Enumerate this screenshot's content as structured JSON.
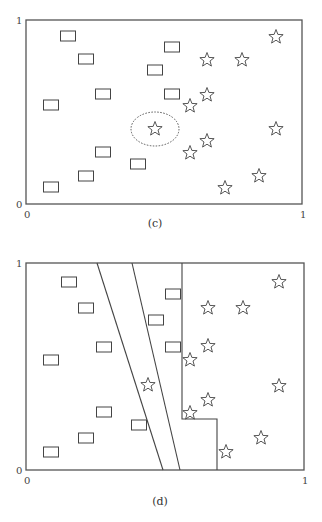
{
  "panels": [
    {
      "id": "c",
      "caption": "(c)",
      "frame": {
        "x": 26,
        "y": 20,
        "w": 276,
        "h": 184
      },
      "ticks": {
        "y_top": "1",
        "y_bottom": "0",
        "x_left": "0",
        "x_right": "1"
      },
      "caption_pos": {
        "x": 155,
        "y": 227
      },
      "rect_markers": [
        [
          68,
          36
        ],
        [
          86,
          59
        ],
        [
          103,
          94
        ],
        [
          51,
          105
        ],
        [
          172,
          47
        ],
        [
          155,
          70
        ],
        [
          172,
          94
        ],
        [
          103,
          152
        ],
        [
          86,
          176
        ],
        [
          51,
          187
        ],
        [
          138,
          164
        ]
      ],
      "star_markers": [
        [
          276,
          37
        ],
        [
          207,
          60
        ],
        [
          242,
          60
        ],
        [
          207,
          95
        ],
        [
          190,
          106
        ],
        [
          155,
          129
        ],
        [
          276,
          129
        ],
        [
          207,
          141
        ],
        [
          190,
          153
        ],
        [
          259,
          176
        ],
        [
          225,
          188
        ]
      ],
      "highlight_ellipse": {
        "cx": 155,
        "cy": 129,
        "rx": 24,
        "ry": 17
      },
      "boundaries": []
    },
    {
      "id": "d",
      "caption": "(d)",
      "frame": {
        "x": 26,
        "y": 263,
        "w": 278,
        "h": 207
      },
      "ticks": {
        "y_top": "1",
        "y_bottom": "0",
        "x_left": "0",
        "x_right": "1"
      },
      "caption_pos": {
        "x": 160,
        "y": 505
      },
      "rect_markers": [
        [
          69,
          282
        ],
        [
          86,
          308
        ],
        [
          104,
          347
        ],
        [
          51,
          360
        ],
        [
          173,
          294
        ],
        [
          156,
          320
        ],
        [
          173,
          347
        ],
        [
          104,
          412
        ],
        [
          86,
          438
        ],
        [
          51,
          452
        ],
        [
          139,
          425
        ]
      ],
      "star_markers": [
        [
          279,
          282
        ],
        [
          208,
          308
        ],
        [
          243,
          308
        ],
        [
          208,
          346
        ],
        [
          190,
          360
        ],
        [
          148,
          385
        ],
        [
          279,
          386
        ],
        [
          208,
          400
        ],
        [
          190,
          413
        ],
        [
          261,
          438
        ],
        [
          226,
          452
        ]
      ],
      "highlight_ellipse": null,
      "boundaries": [
        {
          "name": "linear-boundary-1",
          "points": [
            [
              97,
              263
            ],
            [
              163,
              470
            ]
          ]
        },
        {
          "name": "linear-boundary-2",
          "points": [
            [
              132,
              263
            ],
            [
              180,
              470
            ]
          ]
        },
        {
          "name": "stepwise-boundary",
          "points": [
            [
              182,
              263
            ],
            [
              182,
              419
            ],
            [
              217,
              419
            ],
            [
              217,
              470
            ]
          ]
        }
      ]
    }
  ],
  "marker_legend": {
    "rect": "class A (rectangle)",
    "star": "class B (star)"
  }
}
